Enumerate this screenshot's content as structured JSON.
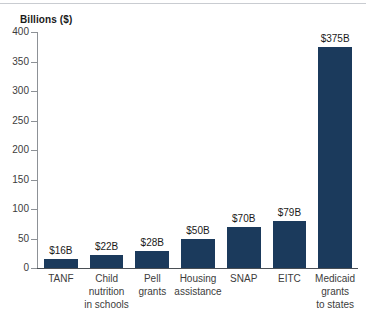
{
  "chart_data": {
    "type": "bar",
    "title": "",
    "subtitle": "",
    "xlabel": "",
    "ylabel": "Billions ($)",
    "ylim": [
      0,
      400
    ],
    "ytick_step": 50,
    "yticks": [
      "400",
      "350",
      "300",
      "250",
      "200",
      "150",
      "100",
      "50",
      "0"
    ],
    "grid": false,
    "legend": false,
    "bar_color": "#1b3a5c",
    "axis_color": "#8d9196",
    "text_color": "#3c3c3c",
    "categories": [
      "TANF",
      "Child nutrition in schools",
      "Pell grants",
      "Housing assistance",
      "SNAP",
      "EITC",
      "Medicaid grants to states"
    ],
    "category_lines": [
      [
        "TANF"
      ],
      [
        "Child",
        "nutrition",
        "in schools"
      ],
      [
        "Pell",
        "grants"
      ],
      [
        "Housing",
        "assistance"
      ],
      [
        "SNAP"
      ],
      [
        "EITC"
      ],
      [
        "Medicaid",
        "grants",
        "to states"
      ]
    ],
    "values": [
      16,
      22,
      28,
      50,
      70,
      79,
      375
    ],
    "data_labels": [
      "$16B",
      "$22B",
      "$28B",
      "$50B",
      "$70B",
      "$79B",
      "$375B"
    ]
  }
}
